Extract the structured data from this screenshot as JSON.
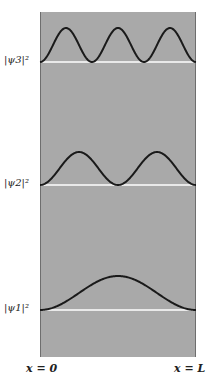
{
  "figure": {
    "levels": [
      {
        "label": "|ψ3|²",
        "n": 3,
        "baseline_y": 62,
        "peak_y": 28
      },
      {
        "label": "|ψ2|²",
        "n": 2,
        "baseline_y": 185,
        "peak_y": 152
      },
      {
        "label": "|ψ1|²",
        "n": 1,
        "baseline_y": 310,
        "peak_y": 276
      }
    ],
    "axis": {
      "left_label": "x = 0",
      "right_label": "x = L"
    },
    "colors": {
      "panel": "#a9a9a9",
      "curve": "#1a1a1a",
      "baseline": "#ffffff"
    }
  }
}
